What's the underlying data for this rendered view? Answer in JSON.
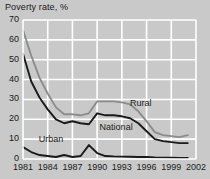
{
  "chart_data": {
    "type": "line",
    "title": "Poverty rate, %",
    "xlabel": "",
    "ylabel": "",
    "ylim": [
      0,
      70
    ],
    "xlim": [
      1981,
      2002
    ],
    "grid": true,
    "legend_position": "inline-annotations",
    "yticks": [
      0,
      10,
      20,
      30,
      40,
      50,
      60,
      70
    ],
    "ytick_labels": [
      "0",
      "10",
      "20",
      "30",
      "40",
      "50",
      "60",
      "70"
    ],
    "xticks": [
      1981,
      1984,
      1987,
      1990,
      1993,
      1996,
      1999,
      2002
    ],
    "xtick_labels": [
      "1981",
      "1984",
      "1987",
      "1990",
      "1993",
      "1996",
      "1999",
      "2002"
    ],
    "x": [
      1981,
      1982,
      1983,
      1984,
      1985,
      1986,
      1987,
      1988,
      1989,
      1990,
      1991,
      1992,
      1993,
      1994,
      1995,
      1996,
      1997,
      1998,
      1999,
      2000,
      2001
    ],
    "series": [
      {
        "name": "Rural",
        "color": "#8c8c8c",
        "values": [
          65,
          52,
          41,
          33,
          26,
          22.5,
          22.5,
          22,
          23,
          29,
          29,
          29,
          28.5,
          27.5,
          24,
          19,
          13.5,
          12,
          11.5,
          11,
          12
        ]
      },
      {
        "name": "National",
        "color": "#1a1a1a",
        "values": [
          53,
          39,
          31,
          25,
          20,
          18,
          19,
          18,
          17.5,
          23,
          22,
          22,
          21.5,
          20.5,
          18,
          14,
          10,
          9,
          8.5,
          8,
          8
        ]
      },
      {
        "name": "Urban",
        "color": "#1a1a1a",
        "values": [
          6,
          3.5,
          2,
          1.5,
          1,
          2,
          1,
          1.5,
          7,
          3,
          1.5,
          1.3,
          1.2,
          1.1,
          1,
          1,
          0.8,
          0.7,
          0.6,
          0.5,
          0.5
        ]
      }
    ],
    "annotations": [
      {
        "text": "Rural",
        "x": 1994.0,
        "y": 27.5
      },
      {
        "text": "National",
        "x": 1990.3,
        "y": 15.5
      },
      {
        "text": "Urban",
        "x": 1982.9,
        "y": 9.5
      }
    ],
    "colors": {
      "background": "#c9c9c9",
      "grid": "#ffffff",
      "text": "#1a1a1a",
      "rural_line": "#8c8c8c",
      "national_line": "#1a1a1a",
      "urban_line": "#1a1a1a"
    }
  }
}
